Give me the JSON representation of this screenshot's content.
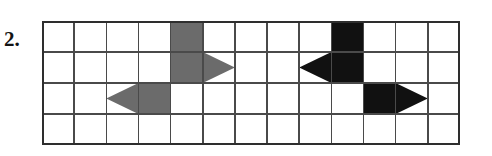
{
  "item": {
    "number_label": "2."
  },
  "grid": {
    "columns": 13,
    "rows": 4,
    "cell_width": 32.15,
    "cell_height": 31.0,
    "origin_x": 0,
    "origin_y": 0,
    "line_color": "#4a4a4a",
    "border_color": "#2e2e2e",
    "background_color": "#ffffff"
  },
  "colors": {
    "gray_shape": "#6b6b6b",
    "black_shape": "#111111",
    "label_text": "#141414"
  },
  "shapes": [
    {
      "name": "gray-arrow-right",
      "color": "#6b6b6b",
      "direction": "right",
      "body_col": 5,
      "body_row_start": 1,
      "body_row_end": 2,
      "tip_col": 6,
      "tip_row": 2,
      "description": "gray arrow pointing right, two cells tall body in column 5 rows 1-2 with triangular head reaching into column 6 on row 2"
    },
    {
      "name": "gray-arrow-left",
      "color": "#6b6b6b",
      "direction": "left",
      "body_col": 4,
      "body_row_start": 3,
      "body_row_end": 3,
      "tip_col": 3,
      "tip_row": 3,
      "description": "gray arrow pointing left, one cell body in column 4 row 3 with triangular head reaching into column 3"
    },
    {
      "name": "black-arrow-left",
      "color": "#111111",
      "direction": "left",
      "body_col": 10,
      "body_row_start": 1,
      "body_row_end": 2,
      "tip_col": 9,
      "tip_row": 2,
      "description": "black arrow pointing left, two cells tall body in column 10 rows 1-2 with triangular head reaching into column 9 on row 2"
    },
    {
      "name": "black-arrow-right",
      "color": "#111111",
      "direction": "right",
      "body_col": 11,
      "body_row_start": 3,
      "body_row_end": 3,
      "tip_col": 12,
      "tip_row": 3,
      "description": "black arrow pointing right, one cell body in column 11 row 3 with triangular head reaching into column 12"
    }
  ]
}
